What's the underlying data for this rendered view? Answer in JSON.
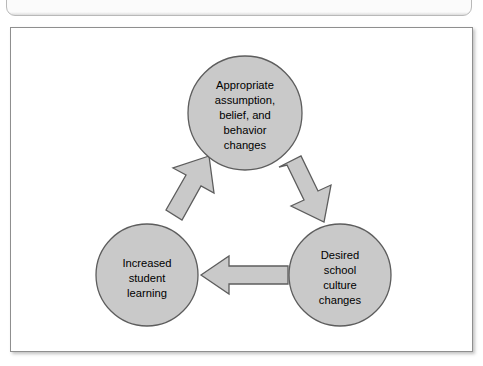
{
  "figure": {
    "caption_strip": {
      "ghost_text": "Figure  ——  clipped caption text (illegible)"
    },
    "diagram": {
      "type": "cycle-diagram",
      "shape": "triangular-cycle",
      "node_fill_color": "#c9c9c9",
      "node_stroke_color": "#5d5d5d",
      "arrow_fill_color": "#c9c9c9",
      "arrow_stroke_color": "#5d5d5d",
      "panel_border_color": "#8f8f8f",
      "background_color": "#ffffff",
      "nodes": [
        {
          "id": "appropriate-changes",
          "position": "top",
          "center_x": 234,
          "center_y": 85,
          "radius": 57,
          "lines": [
            "Appropriate",
            "assumption,",
            "belief, and",
            "behavior",
            "changes"
          ]
        },
        {
          "id": "desired-school-culture",
          "position": "bottom-right",
          "center_x": 329,
          "center_y": 247,
          "radius": 51,
          "lines": [
            "Desired",
            "school",
            "culture",
            "changes"
          ]
        },
        {
          "id": "increased-student-learning",
          "position": "bottom-left",
          "center_x": 136,
          "center_y": 247,
          "radius": 51,
          "lines": [
            "Increased",
            "student",
            "learning"
          ]
        }
      ],
      "arrows": [
        {
          "id": "arrow-top-to-right",
          "from": "appropriate-changes",
          "to": "desired-school-culture",
          "direction": "down-right"
        },
        {
          "id": "arrow-right-to-left",
          "from": "desired-school-culture",
          "to": "increased-student-learning",
          "direction": "left"
        },
        {
          "id": "arrow-left-to-top",
          "from": "increased-student-learning",
          "to": "appropriate-changes",
          "direction": "up-right"
        }
      ]
    }
  }
}
